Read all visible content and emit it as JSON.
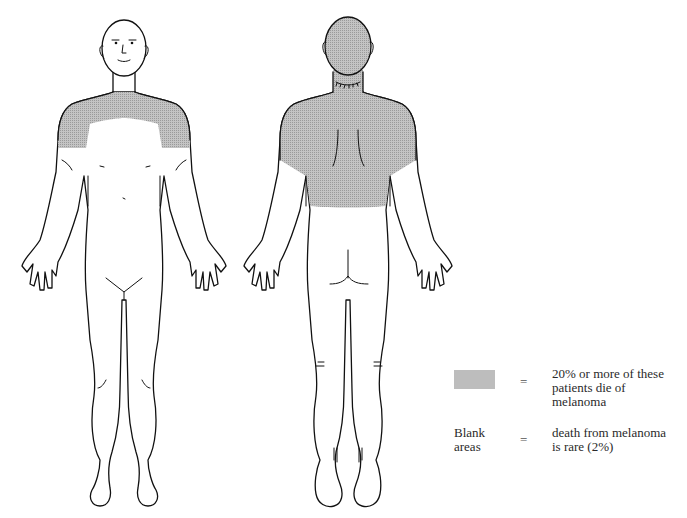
{
  "header": {
    "running_head": ""
  },
  "figure": {
    "views": [
      {
        "id": "front",
        "label": "Front view",
        "shaded_regions": [
          "neck",
          "upper chest",
          "shoulders",
          "upper arms"
        ]
      },
      {
        "id": "back",
        "label": "Back view",
        "shaded_regions": [
          "head",
          "neck",
          "upper back",
          "shoulders",
          "upper arms"
        ]
      }
    ],
    "colors": {
      "shading": "#bdbdbd",
      "outline": "#111111",
      "background": "#ffffff"
    }
  },
  "legend": {
    "items": [
      {
        "key": "shaded",
        "symbol": "shaded-swatch",
        "equals": "=",
        "lines": [
          "20% or more of these",
          "patients die of",
          "melanoma"
        ]
      },
      {
        "key": "blank",
        "symbol_lines": [
          "Blank",
          "areas"
        ],
        "equals": "=",
        "lines": [
          "death from melanoma",
          "is rare (2%)"
        ]
      }
    ]
  }
}
